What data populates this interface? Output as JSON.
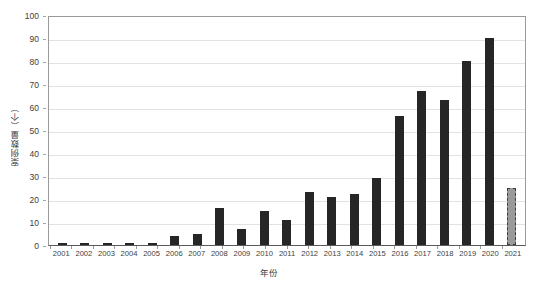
{
  "chart_data": {
    "type": "bar",
    "title": "",
    "xlabel": "年份",
    "ylabel": "案例数量（个）",
    "ylim": [
      0,
      100
    ],
    "y_ticks": [
      0,
      10,
      20,
      30,
      40,
      50,
      60,
      70,
      80,
      90,
      100
    ],
    "grid": true,
    "legend": "none",
    "categories": [
      "2001",
      "2002",
      "2003",
      "2004",
      "2005",
      "2006",
      "2007",
      "2008",
      "2009",
      "2010",
      "2011",
      "2012",
      "2013",
      "2014",
      "2015",
      "2016",
      "2017",
      "2018",
      "2019",
      "2020",
      "2021"
    ],
    "values": [
      1,
      1,
      1,
      1,
      1,
      4,
      5,
      16,
      7,
      15,
      11,
      23,
      21,
      22,
      29,
      56,
      67,
      63,
      80,
      90,
      25
    ],
    "bar_styles": [
      "solid",
      "solid",
      "solid",
      "solid",
      "solid",
      "solid",
      "solid",
      "solid",
      "solid",
      "solid",
      "solid",
      "solid",
      "solid",
      "solid",
      "solid",
      "solid",
      "solid",
      "solid",
      "solid",
      "solid",
      "forecast"
    ],
    "colors": {
      "bar": "#262626",
      "forecast_bar": "#9a9a9a",
      "forecast_border": "#3d3d3d",
      "gridline": "#e2e2e2",
      "axis": "#9a9a9a",
      "text": "#404040"
    }
  }
}
